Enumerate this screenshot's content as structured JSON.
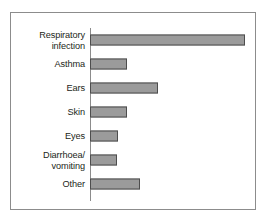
{
  "chart_data": {
    "type": "bar",
    "orientation": "horizontal",
    "title": "",
    "subtitle": "",
    "xlabel": "",
    "ylabel": "",
    "categories": [
      "Respiratory infection",
      "Asthma",
      "Ears",
      "Skin",
      "Eyes",
      "Diarrhoea/ vomiting",
      "Other"
    ],
    "category_lines": [
      [
        "Respiratory",
        "infection"
      ],
      [
        "Asthma"
      ],
      [
        "Ears"
      ],
      [
        "Skin"
      ],
      [
        "Eyes"
      ],
      [
        "Diarrhoea/",
        "vomiting"
      ],
      [
        "Other"
      ]
    ],
    "values": [
      157,
      37,
      69,
      37,
      28,
      27,
      51
    ],
    "xlim": [
      0,
      167
    ],
    "grid": false,
    "legend": null,
    "tick_labels": [],
    "annotations": [],
    "colors": {
      "bar_fill": "#9b9b9b",
      "bar_edge": "#4d4d4d",
      "axis": "#8c8c8c",
      "frame": "#8c8c8c",
      "text": "#231f20",
      "background": "#ffffff"
    }
  }
}
